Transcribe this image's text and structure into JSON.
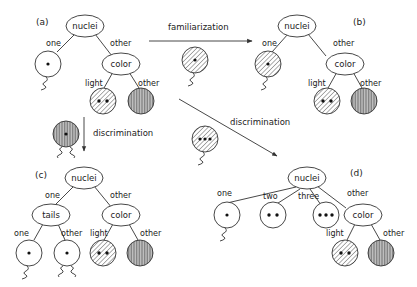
{
  "panels": {
    "a": {
      "label": "(a)"
    },
    "b": {
      "label": "(b)"
    },
    "c": {
      "label": "(c)"
    },
    "d": {
      "label": "(d)"
    }
  },
  "nodes": {
    "nuclei": "nuclei",
    "color": "color",
    "tails": "tails"
  },
  "edges": {
    "one": "one",
    "two": "two",
    "three": "three",
    "other": "other",
    "light": "light"
  },
  "arrows": {
    "familiarization": "familiarization",
    "discrimination_down": "discrimination",
    "discrimination_diag": "discrimination"
  },
  "colors": {
    "line": "#333333",
    "hatch": "#333333",
    "dark_fill": "#9a9a9a",
    "background": "#ffffff"
  }
}
